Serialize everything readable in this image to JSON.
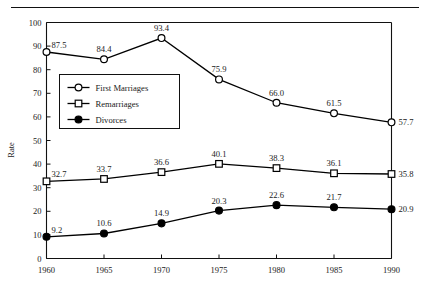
{
  "chart_data": {
    "type": "line",
    "title": "",
    "xlabel": "",
    "ylabel": "Rate",
    "x": [
      1960,
      1965,
      1970,
      1975,
      1980,
      1985,
      1990
    ],
    "categories": [
      "1960",
      "1965",
      "1970",
      "1975",
      "1980",
      "1985",
      "1990"
    ],
    "xlim": [
      1960,
      1990
    ],
    "ylim": [
      0,
      100
    ],
    "yticks": [
      0,
      10,
      20,
      30,
      40,
      50,
      60,
      70,
      80,
      90,
      100
    ],
    "ytick_labels": [
      "0",
      "10",
      "20",
      "30",
      "40",
      "50",
      "60",
      "70",
      "80",
      "90",
      "100"
    ],
    "grid": false,
    "legend_position": "upper-left-inside",
    "series": [
      {
        "name": "First Marriages",
        "marker": "open-circle",
        "color": "#000000",
        "values": [
          87.5,
          84.4,
          93.4,
          75.9,
          66.0,
          61.5,
          57.7
        ],
        "value_labels": [
          "87.5",
          "84.4",
          "93.4",
          "75.9",
          "66.0",
          "61.5",
          "57.7"
        ]
      },
      {
        "name": "Remarriages",
        "marker": "open-square",
        "color": "#000000",
        "values": [
          32.7,
          33.7,
          36.6,
          40.1,
          38.3,
          36.1,
          35.8
        ],
        "value_labels": [
          "32.7",
          "33.7",
          "36.6",
          "40.1",
          "38.3",
          "36.1",
          "35.8"
        ]
      },
      {
        "name": "Divorces",
        "marker": "filled-circle",
        "color": "#000000",
        "values": [
          9.2,
          10.6,
          14.9,
          20.3,
          22.6,
          21.7,
          20.9
        ],
        "value_labels": [
          "9.2",
          "10.6",
          "14.9",
          "20.3",
          "22.6",
          "21.7",
          "20.9"
        ]
      }
    ]
  },
  "legend": {
    "items": [
      {
        "label": "First Marriages"
      },
      {
        "label": "Remarriages"
      },
      {
        "label": "Divorces"
      }
    ]
  },
  "axis": {
    "y_title": "Rate"
  }
}
